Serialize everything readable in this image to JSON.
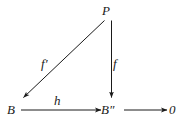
{
  "diagram": {
    "kind": "commutative-diagram",
    "background_color": "#ffffff",
    "ink_color": "#1a1a1a",
    "nodes": [
      {
        "id": "P",
        "label": "P",
        "x": 112,
        "y": 12,
        "name": "node-P"
      },
      {
        "id": "B",
        "label": "B",
        "x": 13,
        "y": 110,
        "name": "node-B"
      },
      {
        "id": "B2",
        "label": "B",
        "prime": "″",
        "x": 108,
        "y": 110,
        "name": "node-B-double-prime"
      },
      {
        "id": "Z",
        "label": "0",
        "x": 173,
        "y": 110,
        "name": "node-zero"
      }
    ],
    "arrows": [
      {
        "id": "fprime",
        "label": "f",
        "prime": "′",
        "from": "P",
        "to": "B",
        "name": "arrow-f-prime"
      },
      {
        "id": "f",
        "label": "f",
        "prime": "",
        "from": "P",
        "to": "B2",
        "name": "arrow-f"
      },
      {
        "id": "h",
        "label": "h",
        "prime": "",
        "from": "B",
        "to": "B2",
        "name": "arrow-h"
      },
      {
        "id": "zero",
        "label": "",
        "prime": "",
        "from": "B2",
        "to": "Z",
        "name": "arrow-to-zero"
      }
    ]
  }
}
